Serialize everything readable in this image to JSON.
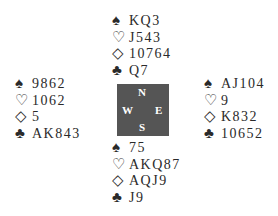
{
  "deal": {
    "north": {
      "spades": "KQ3",
      "hearts": "J543",
      "diamonds": "10764",
      "clubs": "Q7"
    },
    "west": {
      "spades": "9862",
      "hearts": "1062",
      "diamonds": "5",
      "clubs": "AK843"
    },
    "east": {
      "spades": "AJ104",
      "hearts": "9",
      "diamonds": "K832",
      "clubs": "10652"
    },
    "south": {
      "spades": "75",
      "hearts": "AKQ87",
      "diamonds": "AQJ9",
      "clubs": "J9"
    }
  },
  "suits": {
    "spades": "♠",
    "hearts": "♡",
    "diamonds": "◇",
    "clubs": "♣"
  },
  "compass": {
    "n": "N",
    "s": "S",
    "w": "W",
    "e": "E",
    "color": "#555555"
  }
}
